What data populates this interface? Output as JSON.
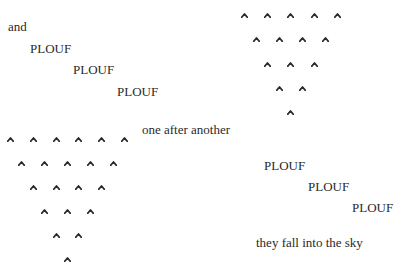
{
  "poem": {
    "left": {
      "intro": "and",
      "plouf": [
        "PLOUF",
        "PLOUF",
        "PLOUF"
      ],
      "outro": "one after another"
    },
    "right": {
      "plouf": [
        "PLOUF",
        "PLOUF",
        "PLOUF"
      ],
      "outro": "they fall into the sky"
    },
    "drop_glyph": "caret",
    "top_right_triangle_rows": [
      5,
      4,
      3,
      2,
      1
    ],
    "bottom_left_triangle_rows": [
      6,
      5,
      4,
      3,
      2,
      1
    ],
    "text_color": "#2a2a2a"
  }
}
